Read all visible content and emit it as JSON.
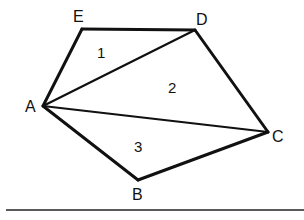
{
  "figure": {
    "type": "pentagon-triangulation",
    "vertices": [
      {
        "id": "A",
        "label": "A"
      },
      {
        "id": "B",
        "label": "B"
      },
      {
        "id": "C",
        "label": "C"
      },
      {
        "id": "D",
        "label": "D"
      },
      {
        "id": "E",
        "label": "E"
      }
    ],
    "polygon_order": [
      "A",
      "B",
      "C",
      "D",
      "E"
    ],
    "diagonals": [
      [
        "A",
        "D"
      ],
      [
        "A",
        "C"
      ]
    ],
    "regions": [
      {
        "label": "1",
        "triangle": [
          "A",
          "D",
          "E"
        ]
      },
      {
        "label": "2",
        "triangle": [
          "A",
          "C",
          "D"
        ]
      },
      {
        "label": "3",
        "triangle": [
          "A",
          "B",
          "C"
        ]
      }
    ]
  }
}
